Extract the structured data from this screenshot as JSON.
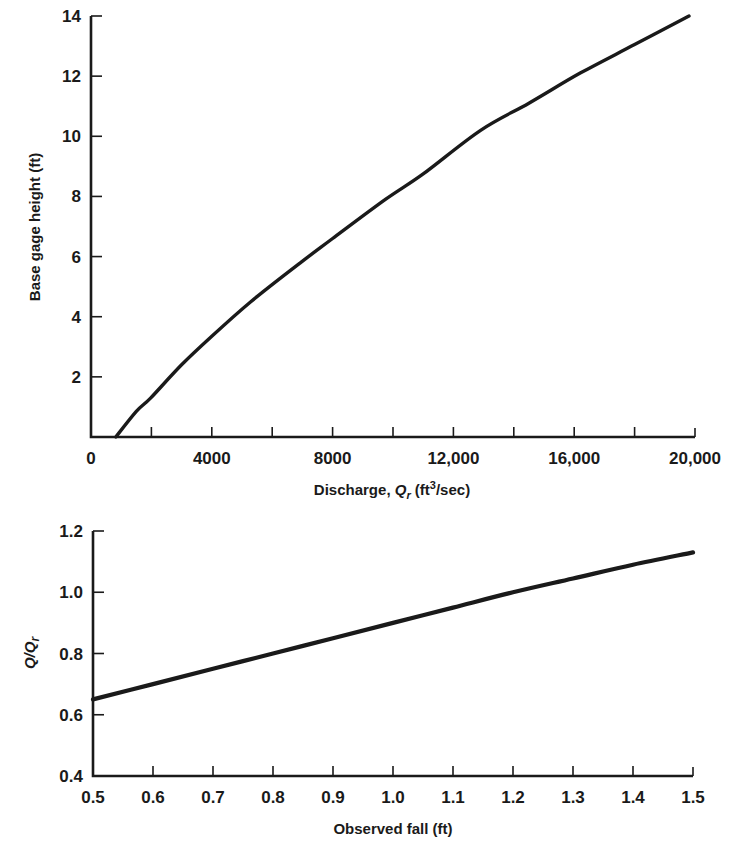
{
  "chart_data": [
    {
      "type": "line",
      "title": "",
      "xlabel": "Discharge, Q_r (ft³/sec)",
      "xlabel_parts": {
        "prefix": "Discharge, ",
        "var": "Q",
        "sub": "r",
        "unit_open": " (ft",
        "sup": "3",
        "unit_close": "/sec)"
      },
      "ylabel": "Base gage height (ft)",
      "xlim": [
        0,
        20000
      ],
      "ylim": [
        0,
        14
      ],
      "x_ticks": [
        0,
        4000,
        8000,
        12000,
        16000,
        20000
      ],
      "x_tick_labels": [
        "0",
        "4000",
        "8000",
        "12,000",
        "16,000",
        "20,000"
      ],
      "x_minor_ticks": [
        2000,
        6000,
        10000,
        14000,
        18000
      ],
      "y_ticks": [
        2,
        4,
        6,
        8,
        10,
        12,
        14
      ],
      "y_tick_labels": [
        "2",
        "4",
        "6",
        "8",
        "10",
        "12",
        "14"
      ],
      "grid": false,
      "series": [
        {
          "name": "rating curve",
          "x": [
            820,
            1500,
            1980,
            3000,
            4000,
            5290,
            6940,
            8000,
            9750,
            11000,
            12900,
            14500,
            16200,
            18000,
            19800
          ],
          "y": [
            0,
            0.85,
            1.3,
            2.4,
            3.35,
            4.5,
            5.8,
            6.6,
            7.9,
            8.75,
            10.2,
            11.1,
            12.1,
            13.05,
            14.0
          ]
        }
      ]
    },
    {
      "type": "line",
      "title": "",
      "xlabel": "Observed fall (ft)",
      "ylabel": "Q/Q_r",
      "ylabel_parts": {
        "a": "Q/Q",
        "sub": "r"
      },
      "xlim": [
        0.5,
        1.5
      ],
      "ylim": [
        0.4,
        1.2
      ],
      "x_ticks": [
        0.5,
        0.6,
        0.7,
        0.8,
        0.9,
        1.0,
        1.1,
        1.2,
        1.3,
        1.4,
        1.5
      ],
      "x_tick_labels": [
        "0.5",
        "0.6",
        "0.7",
        "0.8",
        "0.9",
        "1.0",
        "1.1",
        "1.2",
        "1.3",
        "1.4",
        "1.5"
      ],
      "y_ticks": [
        0.4,
        0.6,
        0.8,
        1.0,
        1.2
      ],
      "y_tick_labels": [
        "0.4",
        "0.6",
        "0.8",
        "1.0",
        "1.2"
      ],
      "grid": false,
      "series": [
        {
          "name": "fall ratio curve",
          "x": [
            0.5,
            0.6,
            0.7,
            0.8,
            0.9,
            1.0,
            1.1,
            1.2,
            1.3,
            1.4,
            1.5
          ],
          "y": [
            0.65,
            0.7,
            0.75,
            0.8,
            0.85,
            0.9,
            0.95,
            1.0,
            1.045,
            1.09,
            1.13
          ]
        }
      ]
    }
  ]
}
